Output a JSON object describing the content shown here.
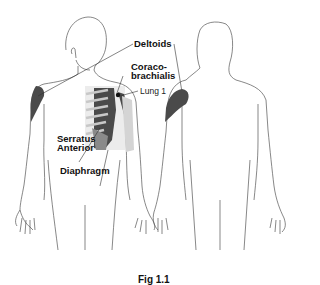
{
  "figure": {
    "labels": {
      "deltoids": "Deltoids",
      "coraco_line1": "Coraco-",
      "coraco_line2": "brachialis",
      "lung": "Lung 1",
      "serratus_line1": "Serratus",
      "serratus_line2": "Anterior",
      "diaphragm": "Diaphragm"
    },
    "caption": "Fig 1.1",
    "views": [
      "front",
      "back"
    ],
    "colors": {
      "muscle_dark": "#4a4a4a",
      "muscle_mid": "#8a8a8a",
      "muscle_light": "#c8c8c8",
      "outline": "#555555",
      "lung_point": "#111111"
    }
  }
}
